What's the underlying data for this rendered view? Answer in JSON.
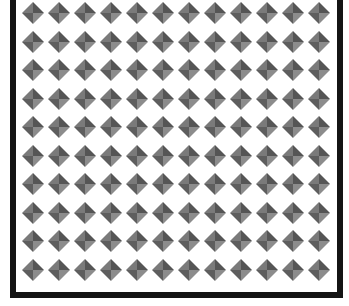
{
  "pattern": {
    "name": "pyramid-stud-grid",
    "columns": 12,
    "rows": 10,
    "first_center": {
      "x": 33,
      "y": 13
    },
    "pitch": {
      "x": 26,
      "y": 28.5
    },
    "stud_size": 22
  },
  "frame": {
    "border_color": "#141414"
  },
  "colors": {
    "background": "#ffffff",
    "face_top_left": "#7a7a7a",
    "face_top_right": "#555555",
    "face_bottom_left": "#5e5e5e",
    "face_bottom_right": "#8c8c8c"
  }
}
